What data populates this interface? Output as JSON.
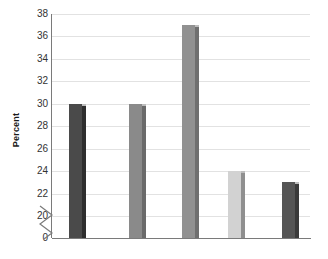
{
  "chart_data": {
    "type": "bar",
    "title": "",
    "subtitle": "",
    "xlabel": "",
    "ylabel": "Percent",
    "categories": [
      "",
      "",
      "",
      "",
      ""
    ],
    "values": [
      30,
      30,
      37,
      24,
      23
    ],
    "ylim": [
      20,
      38
    ],
    "y_axis_break": true,
    "y_axis_break_from": 0,
    "y_axis_break_to": 20,
    "y_tick_values": [
      0,
      20,
      22,
      24,
      26,
      28,
      30,
      32,
      34,
      36,
      38
    ],
    "y_tick_labels": [
      "0",
      "20",
      "22",
      "24",
      "26",
      "28",
      "30",
      "32",
      "34",
      "36",
      "38"
    ],
    "grid": true,
    "grid_axis": "y",
    "legend": false,
    "legend_position": "none",
    "bar_colors": [
      "#4a4a4a",
      "#8a8a8a",
      "#919191",
      "#d2d2d2",
      "#555555"
    ],
    "bar_side_colors": [
      "#2e2e2e",
      "#6a6a6a",
      "#6f6f6f",
      "#8f8f8f",
      "#3a3a3a"
    ],
    "annotations": []
  },
  "axis": {
    "y_title": "Percent",
    "break_icon": "axis-break-zigzag-icon"
  },
  "colors": {
    "gridline": "#e2e2e2",
    "axis": "#7a7a7a",
    "tick_text": "#333333",
    "background": "#ffffff"
  }
}
